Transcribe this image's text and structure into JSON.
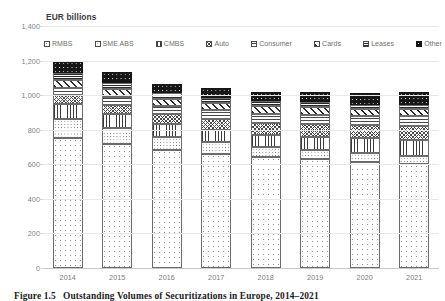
{
  "axis_title": "EUR billions",
  "caption": {
    "number": "Figure 1.5",
    "text": "Outstanding Volumes of Securitizations in Europe, 2014–2021"
  },
  "legend": [
    {
      "label": "RMBS",
      "pattern": "p-rmbs"
    },
    {
      "label": "SME ABS",
      "pattern": "p-smeabs"
    },
    {
      "label": "CMBS",
      "pattern": "p-cmbs"
    },
    {
      "label": "Auto",
      "pattern": "p-auto"
    },
    {
      "label": "Consumer",
      "pattern": "p-consumer"
    },
    {
      "label": "Cards",
      "pattern": "p-cards"
    },
    {
      "label": "Leases",
      "pattern": "p-leases"
    },
    {
      "label": "Other",
      "pattern": "p-other"
    }
  ],
  "yticks": [
    "1,400",
    "1,200",
    "1,000",
    "800",
    "600",
    "400",
    "200",
    "0"
  ],
  "chart_data": {
    "type": "bar",
    "subtype": "stacked-column",
    "title": "Outstanding Volumes of Securitizations in Europe, 2014–2021",
    "xlabel": "",
    "ylabel": "EUR billions",
    "ylim": [
      0,
      1400
    ],
    "ytick_step": 200,
    "grid": true,
    "legend_position": "top",
    "categories": [
      "2014",
      "2015",
      "2016",
      "2017",
      "2018",
      "2019",
      "2020",
      "2021"
    ],
    "series": [
      {
        "name": "RMBS",
        "values": [
          755,
          715,
          680,
          660,
          640,
          630,
          615,
          600
        ]
      },
      {
        "name": "SME ABS",
        "values": [
          105,
          95,
          80,
          70,
          62,
          55,
          50,
          46
        ]
      },
      {
        "name": "CMBS",
        "values": [
          88,
          80,
          72,
          68,
          66,
          72,
          88,
          95
        ]
      },
      {
        "name": "Auto",
        "values": [
          52,
          55,
          60,
          64,
          70,
          74,
          72,
          78
        ]
      },
      {
        "name": "Consumer",
        "values": [
          42,
          45,
          48,
          50,
          54,
          56,
          54,
          58
        ]
      },
      {
        "name": "Cards",
        "values": [
          48,
          45,
          40,
          42,
          44,
          44,
          40,
          42
        ]
      },
      {
        "name": "Leases",
        "values": [
          38,
          38,
          32,
          30,
          28,
          29,
          26,
          26
        ]
      },
      {
        "name": "Other",
        "values": [
          67,
          62,
          53,
          56,
          56,
          60,
          65,
          75
        ]
      }
    ],
    "totals": [
      1195,
      1135,
      1065,
      1040,
      1020,
      1020,
      1010,
      1020
    ]
  }
}
